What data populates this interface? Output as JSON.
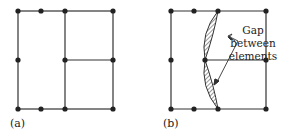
{
  "figure": {
    "panel_a": {
      "label": "(a)",
      "nodes": [
        [
          18,
          11
        ],
        [
          41,
          11
        ],
        [
          65,
          11
        ],
        [
          113,
          11
        ],
        [
          18,
          60
        ],
        [
          65,
          60
        ],
        [
          113,
          60
        ],
        [
          18,
          109
        ],
        [
          41,
          109
        ],
        [
          65,
          109
        ],
        [
          113,
          109
        ]
      ]
    },
    "panel_b": {
      "label": "(b)",
      "nodes": [
        [
          171,
          11
        ],
        [
          194,
          11
        ],
        [
          218,
          11
        ],
        [
          266,
          11
        ],
        [
          171,
          60
        ],
        [
          205,
          60
        ],
        [
          266,
          60
        ],
        [
          171,
          109
        ],
        [
          194,
          109
        ],
        [
          218,
          109
        ],
        [
          266,
          109
        ]
      ],
      "annotation_line1": "Gap between",
      "annotation_line2": "elements"
    },
    "colors": {
      "line": "#333333",
      "node": "#222222",
      "text": "#222222"
    }
  }
}
